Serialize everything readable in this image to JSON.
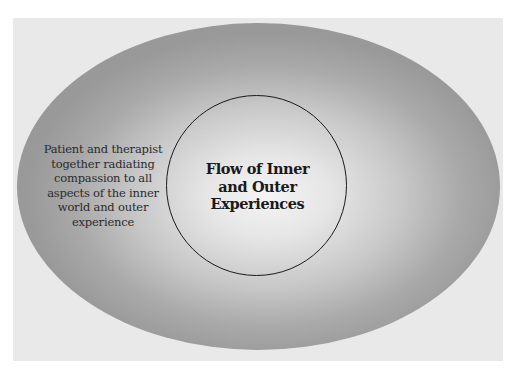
{
  "diagram": {
    "outer_ellipse": {
      "label_lines": [
        "Patient and therapist",
        "together radiating",
        "compassion to all",
        "aspects of the inner",
        "world and outer",
        "experience"
      ]
    },
    "inner_circle": {
      "label_lines": [
        "Flow of Inner",
        "and Outer",
        "Experiences"
      ]
    },
    "colors": {
      "frame_background": "#e9e9e9",
      "ellipse_edge": "#999999",
      "ellipse_center": "#f4f4f4",
      "circle_stroke": "#1a1a1a"
    }
  }
}
